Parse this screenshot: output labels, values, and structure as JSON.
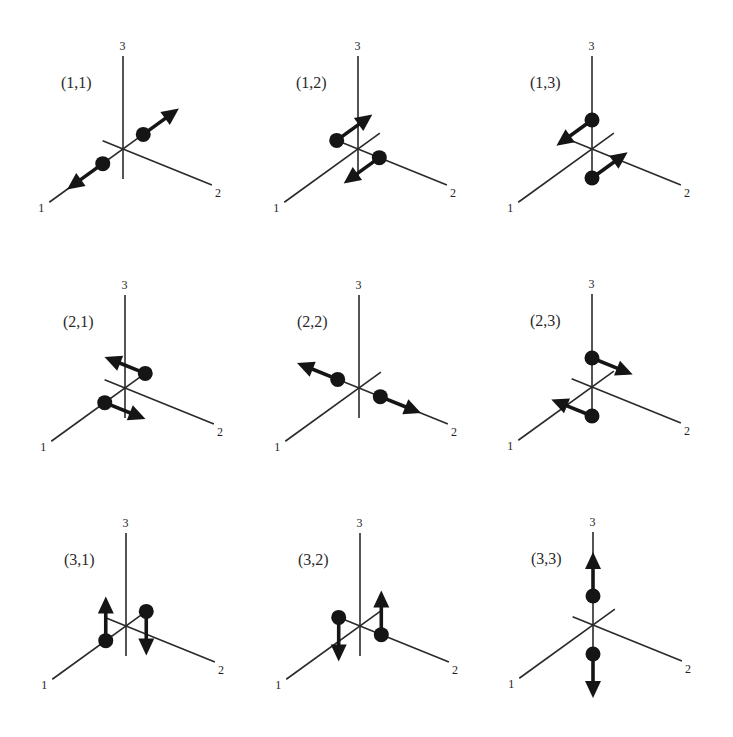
{
  "figure": {
    "axis_labels": {
      "axis1": "1",
      "axis2": "2",
      "axis3": "3"
    },
    "panels": [
      {
        "row": 1,
        "col": 1,
        "title": "(1,1)",
        "dot_axis": 1,
        "arrow_axis": 1,
        "origin": [
          123,
          149
        ]
      },
      {
        "row": 1,
        "col": 2,
        "title": "(1,2)",
        "dot_axis": 2,
        "arrow_axis": 1,
        "origin": [
          358,
          149
        ]
      },
      {
        "row": 1,
        "col": 3,
        "title": "(1,3)",
        "dot_axis": 3,
        "arrow_axis": 1,
        "origin": [
          592,
          149
        ]
      },
      {
        "row": 2,
        "col": 1,
        "title": "(2,1)",
        "dot_axis": 1,
        "arrow_axis": 2,
        "origin": [
          125,
          388
        ]
      },
      {
        "row": 2,
        "col": 2,
        "title": "(2,2)",
        "dot_axis": 2,
        "arrow_axis": 2,
        "origin": [
          359,
          388
        ]
      },
      {
        "row": 2,
        "col": 3,
        "title": "(2,3)",
        "dot_axis": 3,
        "arrow_axis": 2,
        "origin": [
          592,
          387
        ]
      },
      {
        "row": 3,
        "col": 1,
        "title": "(3,1)",
        "dot_axis": 1,
        "arrow_axis": 3,
        "origin": [
          126,
          626
        ]
      },
      {
        "row": 3,
        "col": 2,
        "title": "(3,2)",
        "dot_axis": 2,
        "arrow_axis": 3,
        "origin": [
          360,
          626
        ]
      },
      {
        "row": 3,
        "col": 3,
        "title": "(3,3)",
        "dot_axis": 3,
        "arrow_axis": 3,
        "origin": [
          593,
          625
        ]
      }
    ]
  }
}
